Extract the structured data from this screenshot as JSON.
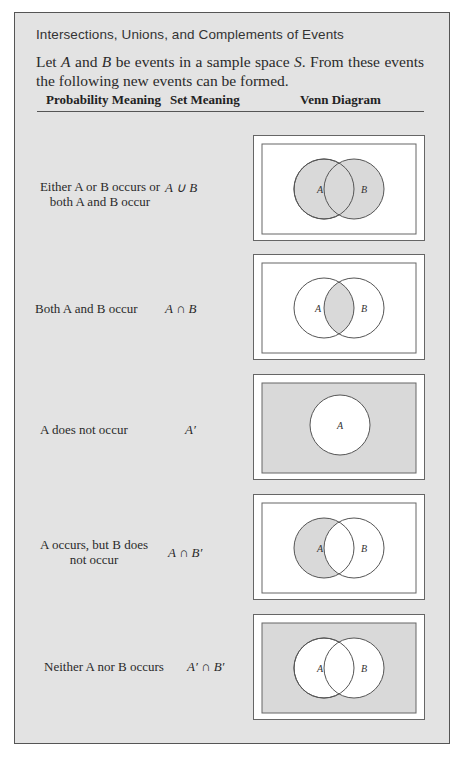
{
  "header": {
    "title": "Intersections, Unions, and Complements of Events",
    "intro_parts": [
      "Let ",
      "A",
      " and ",
      "B",
      " be events in a sample space ",
      "S",
      ". From these events the following new events can be formed."
    ]
  },
  "table": {
    "columns": [
      "Probability Meaning",
      "Set Meaning",
      "Venn Diagram"
    ],
    "rows": [
      {
        "probability_meaning": "Either A or B occurs or both A and B occur",
        "set_meaning": "A ∪ B",
        "venn": {
          "shaded": "union",
          "labels": [
            "A",
            "B"
          ]
        }
      },
      {
        "probability_meaning": "Both A and B occur",
        "set_meaning": "A ∩ B",
        "venn": {
          "shaded": "intersection",
          "labels": [
            "A",
            "B"
          ]
        }
      },
      {
        "probability_meaning": "A does not occur",
        "set_meaning": "A′",
        "venn": {
          "shaded": "complement-A",
          "labels": [
            "A"
          ]
        }
      },
      {
        "probability_meaning": "A occurs, but B does not occur",
        "set_meaning": "A ∩ B′",
        "venn": {
          "shaded": "A-minus-B",
          "labels": [
            "A",
            "B"
          ]
        }
      },
      {
        "probability_meaning": "Neither A nor B occurs",
        "set_meaning": "A′ ∩ B′",
        "venn": {
          "shaded": "neither",
          "labels": [
            "A",
            "B"
          ]
        }
      }
    ]
  },
  "colors": {
    "background": "#e3e3e3",
    "shade": "#d9d9d9",
    "card": "#ffffff",
    "stroke": "#555555"
  }
}
